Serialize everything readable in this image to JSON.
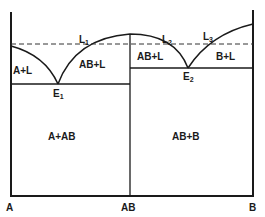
{
  "diagram": {
    "type": "binary phase diagram with congruent melting compound",
    "axis_labels": {
      "left": "A",
      "middle": "AB",
      "right": "B"
    },
    "regions": {
      "a_plus_liquid": "A+L",
      "ab_plus_liquid_left": "AB+L",
      "ab_plus_liquid_right": "AB+L",
      "b_plus_liquid": "B+L",
      "a_plus_ab": "A+AB",
      "ab_plus_b": "AB+B"
    },
    "points": {
      "e1": {
        "main": "E",
        "sub": "1"
      },
      "e2": {
        "main": "E",
        "sub": "2"
      },
      "l1": {
        "main": "L",
        "sub": "1"
      },
      "l2": {
        "main": "L",
        "sub": "2"
      },
      "l3": {
        "main": "L",
        "sub": "3"
      }
    },
    "line_color": "#1a1a1a"
  }
}
